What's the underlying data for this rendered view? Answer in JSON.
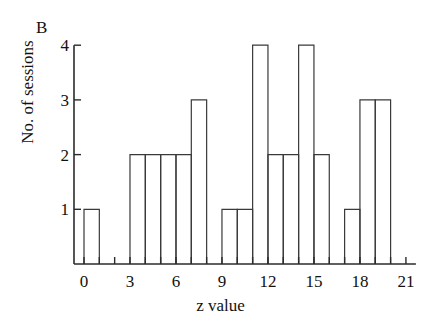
{
  "panel": {
    "label": "B"
  },
  "chart_data": {
    "type": "bar",
    "title": "",
    "subtitle": "",
    "xlabel": "z value",
    "ylabel": "No. of sessions",
    "grid": false,
    "legend": null,
    "xlim": [
      -1,
      22
    ],
    "ylim": [
      0,
      4
    ],
    "bin_width": 1,
    "xtick_labels": [
      "0",
      "3",
      "6",
      "9",
      "12",
      "15",
      "18",
      "21"
    ],
    "xtick_values": [
      0,
      3,
      6,
      9,
      12,
      15,
      18,
      21
    ],
    "xtick_minor_values": [
      0,
      1,
      2,
      3,
      4,
      5,
      6,
      7,
      8,
      9,
      10,
      11,
      12,
      13,
      14,
      15,
      16,
      17,
      18,
      19,
      20,
      21
    ],
    "ytick_labels": [
      "1",
      "2",
      "3",
      "4"
    ],
    "ytick_values": [
      1,
      2,
      3,
      4
    ],
    "bin_starts": [
      0,
      1,
      2,
      3,
      4,
      5,
      6,
      7,
      8,
      9,
      10,
      11,
      12,
      13,
      14,
      15,
      16,
      17,
      18,
      19,
      20
    ],
    "categories": [
      "0-1",
      "1-2",
      "2-3",
      "3-4",
      "4-5",
      "5-6",
      "6-7",
      "7-8",
      "8-9",
      "9-10",
      "10-11",
      "11-12",
      "12-13",
      "13-14",
      "14-15",
      "15-16",
      "16-17",
      "17-18",
      "18-19",
      "19-20",
      "20-21"
    ],
    "values": [
      1,
      0,
      0,
      2,
      2,
      2,
      2,
      3,
      0,
      1,
      1,
      4,
      2,
      2,
      4,
      2,
      0,
      1,
      3,
      3,
      0
    ],
    "colors": {
      "bar_stroke": "#3a3a3a",
      "bar_fill": "none",
      "axis": "#2b2b2b",
      "text": "#111111"
    }
  }
}
